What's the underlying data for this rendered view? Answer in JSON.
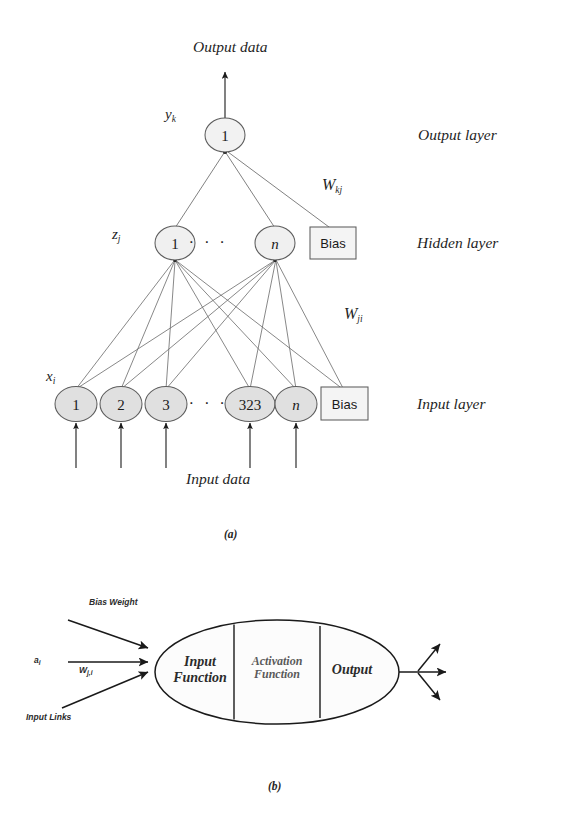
{
  "figure": {
    "caption_a": "(a)",
    "caption_b": "(b)"
  },
  "panel_a": {
    "title_top": "Output data",
    "title_bottom": "Input data",
    "layer_names": {
      "output": "Output layer",
      "hidden": "Hidden layer",
      "input": "Input layer"
    },
    "variables": {
      "output_var": "y",
      "output_sub": "k",
      "hidden_var": "z",
      "hidden_sub": "j",
      "input_var": "x",
      "input_sub": "i"
    },
    "weights": {
      "output_hidden": "W",
      "output_hidden_sub": "kj",
      "hidden_input": "W",
      "hidden_input_sub": "ji"
    },
    "output_layer": {
      "nodes": [
        {
          "label": "1",
          "cx": 225,
          "cy": 135,
          "italic": false
        }
      ]
    },
    "hidden_layer": {
      "nodes": [
        {
          "label": "1",
          "cx": 175,
          "cy": 243,
          "italic": false
        },
        {
          "label": "n",
          "cx": 275,
          "cy": 243,
          "italic": true
        }
      ],
      "ellipsis": "· · ·",
      "ellipsis_x": 225,
      "ellipsis_y": 243,
      "bias": {
        "label": "Bias",
        "cx": 333,
        "cy": 243
      }
    },
    "input_layer": {
      "nodes": [
        {
          "label": "1",
          "cx": 76,
          "cy": 404,
          "italic": false
        },
        {
          "label": "2",
          "cx": 121,
          "cy": 404,
          "italic": false
        },
        {
          "label": "3",
          "cx": 166,
          "cy": 404,
          "italic": false
        },
        {
          "label": "323",
          "cx": 250,
          "cy": 404,
          "italic": false
        },
        {
          "label": "n",
          "cx": 296,
          "cy": 404,
          "italic": true
        }
      ],
      "ellipsis": "· · ·",
      "ellipsis_x": 208,
      "ellipsis_y": 404,
      "bias": {
        "label": "Bias",
        "cx": 344,
        "cy": 404
      }
    },
    "colors": {
      "node_fill_input": "#e0e0e0",
      "node_fill_hidden": "#f0f0f0",
      "node_fill_output": "#f2f2f2",
      "stroke": "#5d5d5d",
      "bias_fill": "#f4f4f4",
      "arrow": "#1a1a1a"
    }
  },
  "panel_b": {
    "labels": {
      "bias_weight": "Bias Weight",
      "activation_input": "a",
      "activation_input_sub": "i",
      "weight": "W",
      "weight_sub": "j,i",
      "input_links": "Input Links"
    },
    "cells": [
      {
        "line1": "Input",
        "line2": "Function"
      },
      {
        "line1": "Activation",
        "line2": "Function"
      },
      {
        "line1": "Output",
        "line2": ""
      }
    ],
    "colors": {
      "stroke": "#1a1a1a",
      "fill": "#fcfcfc"
    }
  }
}
